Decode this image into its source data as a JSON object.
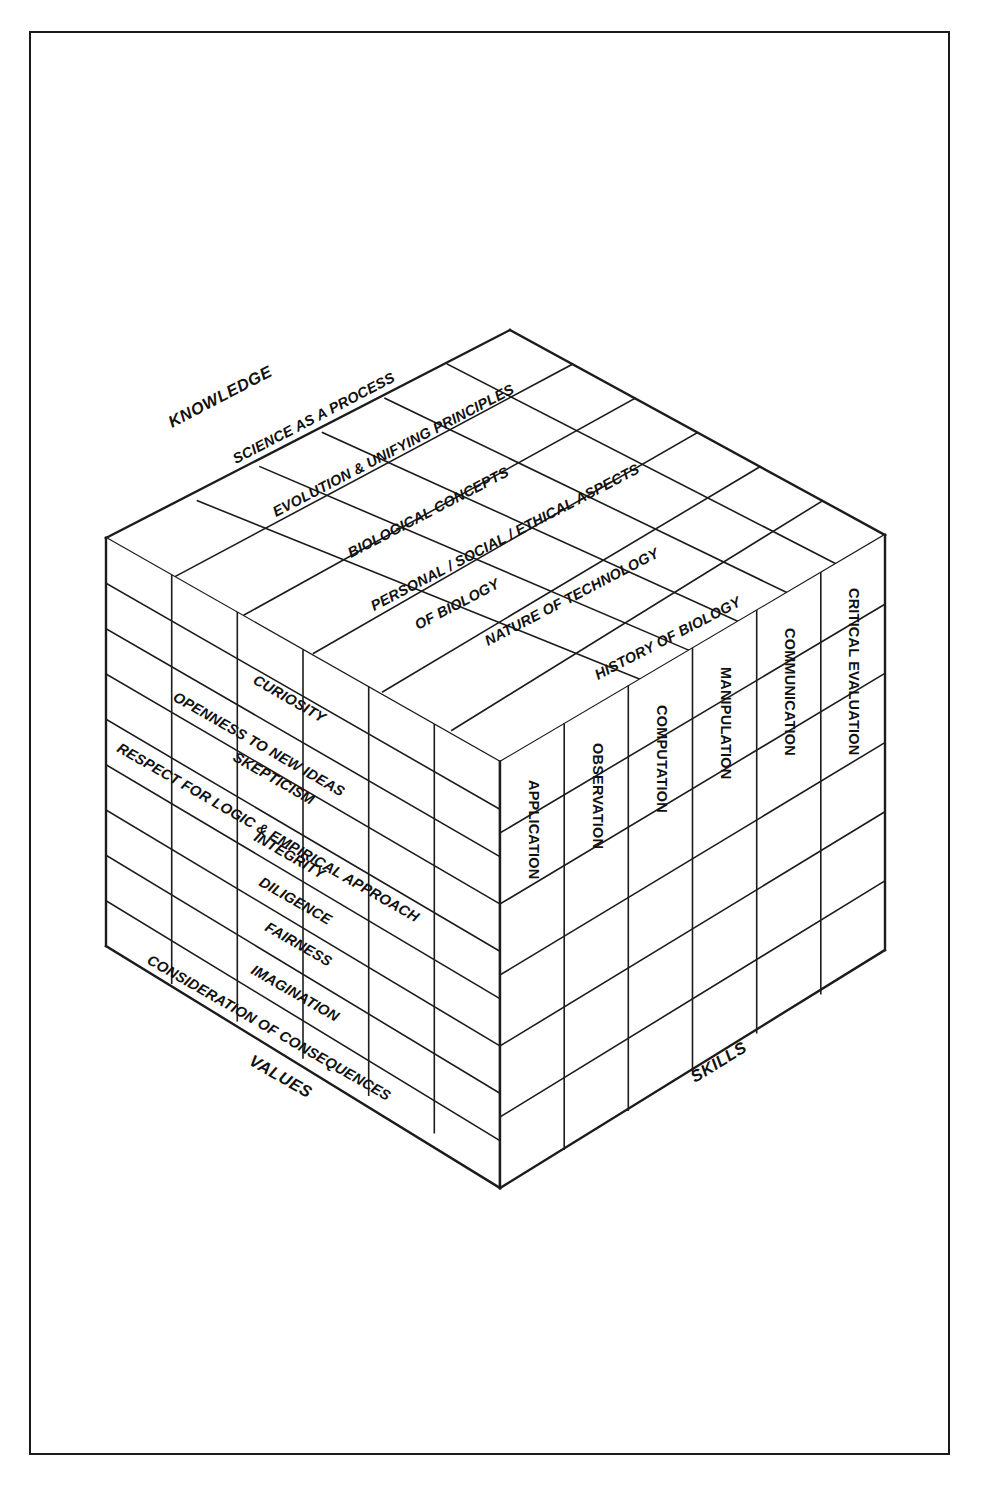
{
  "figure": {
    "type": "three-dimensional-cube-diagram",
    "axes": [
      {
        "id": "knowledge",
        "label": "KNOWLEDGE",
        "face": "top"
      },
      {
        "id": "values",
        "label": "VALUES",
        "face": "left"
      },
      {
        "id": "skills",
        "label": "SKILLS",
        "face": "right"
      }
    ]
  },
  "knowledge": {
    "axis_label": "KNOWLEDGE",
    "items": [
      "SCIENCE AS A PROCESS",
      "EVOLUTION & UNIFYING PRINCIPLES",
      "BIOLOGICAL CONCEPTS",
      "PERSONAL / SOCIAL / ETHICAL ASPECTS",
      "OF BIOLOGY",
      "NATURE OF TECHNOLOGY",
      "HISTORY OF BIOLOGY"
    ],
    "rows": [
      {
        "line1": "SCIENCE AS A PROCESS",
        "line2": ""
      },
      {
        "line1": "EVOLUTION & UNIFYING PRINCIPLES",
        "line2": ""
      },
      {
        "line1": "BIOLOGICAL CONCEPTS",
        "line2": ""
      },
      {
        "line1": "PERSONAL / SOCIAL / ETHICAL ASPECTS",
        "line2": "OF BIOLOGY"
      },
      {
        "line1": "NATURE OF TECHNOLOGY",
        "line2": ""
      },
      {
        "line1": "HISTORY OF BIOLOGY",
        "line2": ""
      }
    ]
  },
  "values": {
    "axis_label": "VALUES",
    "items": [
      "CURIOSITY",
      "OPENNESS TO NEW IDEAS",
      "SKEPTICISM",
      "RESPECT FOR LOGIC & EMPIRICAL APPROACH",
      "INTEGRITY",
      "DILIGENCE",
      "FAIRNESS",
      "IMAGINATION",
      "CONSIDERATION OF CONSEQUENCES"
    ]
  },
  "skills": {
    "axis_label": "SKILLS",
    "items": [
      "APPLICATION",
      "OBSERVATION",
      "COMPUTATION",
      "MANIPULATION",
      "COMMUNICATION",
      "CRITICAL EVALUATION"
    ]
  },
  "grid": {
    "columns": 6,
    "top_rows": 6,
    "left_rows": 9,
    "right_rows": 6
  },
  "colors": {
    "line": "#1c1c1c",
    "background": "#ffffff",
    "text": "#111111"
  }
}
